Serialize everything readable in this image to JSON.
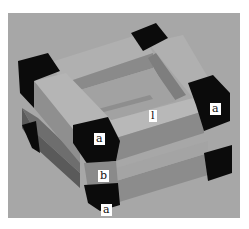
{
  "figure": {
    "background_color": "#a7a7a7",
    "colors": {
      "corner_block": "#0b0b0b",
      "top_face": "#b3b3b3",
      "side_face_light": "#9a9a9a",
      "side_face_dark": "#7b7b7b",
      "inner_face": "#8a8a8a"
    },
    "labels": [
      {
        "id": "a1",
        "text": "a",
        "position": "front-left top corner block"
      },
      {
        "id": "a2",
        "text": "a",
        "position": "right top corner block"
      },
      {
        "id": "a3",
        "text": "a",
        "position": "front-left bottom corner block"
      },
      {
        "id": "b",
        "text": "b",
        "position": "front-left middle spacer"
      },
      {
        "id": "l",
        "text": "l",
        "position": "center inner beam"
      }
    ]
  }
}
